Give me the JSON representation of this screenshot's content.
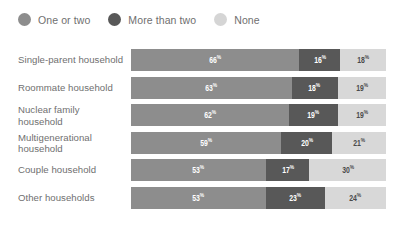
{
  "legend": {
    "items": [
      {
        "label": "One or two",
        "color": "#8d8d8d",
        "icon": "circle-swatch-icon"
      },
      {
        "label": "More than two",
        "color": "#585858",
        "icon": "circle-swatch-icon"
      },
      {
        "label": "None",
        "color": "#d5d5d5",
        "icon": "circle-swatch-icon"
      }
    ]
  },
  "rows": [
    {
      "label": "Single-parent household",
      "segments": [
        {
          "value": "66",
          "suffix": "%",
          "series": "One or two",
          "color": "#8d8d8d",
          "text_color": "#ffffff",
          "pct": 66
        },
        {
          "value": "16",
          "suffix": "%",
          "series": "More than two",
          "color": "#585858",
          "text_color": "#ffffff",
          "pct": 16
        },
        {
          "value": "18",
          "suffix": "%",
          "series": "None",
          "color": "#d8d8d8",
          "text_color": "#4a4a4a",
          "pct": 18
        }
      ]
    },
    {
      "label": "Roommate household",
      "segments": [
        {
          "value": "63",
          "suffix": "%",
          "series": "One or two",
          "color": "#8d8d8d",
          "text_color": "#ffffff",
          "pct": 63
        },
        {
          "value": "18",
          "suffix": "%",
          "series": "More than two",
          "color": "#585858",
          "text_color": "#ffffff",
          "pct": 18
        },
        {
          "value": "19",
          "suffix": "%",
          "series": "None",
          "color": "#d8d8d8",
          "text_color": "#4a4a4a",
          "pct": 19
        }
      ]
    },
    {
      "label": "Nuclear family household",
      "segments": [
        {
          "value": "62",
          "suffix": "%",
          "series": "One or two",
          "color": "#8d8d8d",
          "text_color": "#ffffff",
          "pct": 62
        },
        {
          "value": "19",
          "suffix": "%",
          "series": "More than two",
          "color": "#585858",
          "text_color": "#ffffff",
          "pct": 19
        },
        {
          "value": "19",
          "suffix": "%",
          "series": "None",
          "color": "#d8d8d8",
          "text_color": "#4a4a4a",
          "pct": 19
        }
      ]
    },
    {
      "label": "Multigenerational household",
      "segments": [
        {
          "value": "59",
          "suffix": "%",
          "series": "One or two",
          "color": "#8d8d8d",
          "text_color": "#ffffff",
          "pct": 59
        },
        {
          "value": "20",
          "suffix": "%",
          "series": "More than two",
          "color": "#585858",
          "text_color": "#ffffff",
          "pct": 20
        },
        {
          "value": "21",
          "suffix": "%",
          "series": "None",
          "color": "#d8d8d8",
          "text_color": "#4a4a4a",
          "pct": 21
        }
      ]
    },
    {
      "label": "Couple household",
      "segments": [
        {
          "value": "53",
          "suffix": "%",
          "series": "One or two",
          "color": "#8d8d8d",
          "text_color": "#ffffff",
          "pct": 53
        },
        {
          "value": "17",
          "suffix": "%",
          "series": "More than two",
          "color": "#585858",
          "text_color": "#ffffff",
          "pct": 17
        },
        {
          "value": "30",
          "suffix": "%",
          "series": "None",
          "color": "#d8d8d8",
          "text_color": "#4a4a4a",
          "pct": 30
        }
      ]
    },
    {
      "label": "Other households",
      "segments": [
        {
          "value": "53",
          "suffix": "%",
          "series": "One or two",
          "color": "#8d8d8d",
          "text_color": "#ffffff",
          "pct": 53
        },
        {
          "value": "23",
          "suffix": "%",
          "series": "More than two",
          "color": "#585858",
          "text_color": "#ffffff",
          "pct": 23
        },
        {
          "value": "24",
          "suffix": "%",
          "series": "None",
          "color": "#d8d8d8",
          "text_color": "#4a4a4a",
          "pct": 24
        }
      ]
    }
  ],
  "chart_data": {
    "type": "bar",
    "orientation": "horizontal",
    "stacked": true,
    "normalized_100": true,
    "title": "",
    "subtitle": "",
    "xlabel": "",
    "ylabel": "",
    "xlim": [
      0,
      100
    ],
    "grid": false,
    "legend_position": "top-left",
    "value_suffix": "%",
    "categories": [
      "Single-parent household",
      "Roommate household",
      "Nuclear family household",
      "Multigenerational household",
      "Couple household",
      "Other households"
    ],
    "series": [
      {
        "name": "One or two",
        "color": "#8d8d8d",
        "values": [
          66,
          63,
          62,
          59,
          53,
          53
        ]
      },
      {
        "name": "More than two",
        "color": "#585858",
        "values": [
          16,
          18,
          19,
          20,
          17,
          23
        ]
      },
      {
        "name": "None",
        "color": "#d8d8d8",
        "values": [
          18,
          19,
          19,
          21,
          30,
          24
        ]
      }
    ],
    "annotations": []
  }
}
